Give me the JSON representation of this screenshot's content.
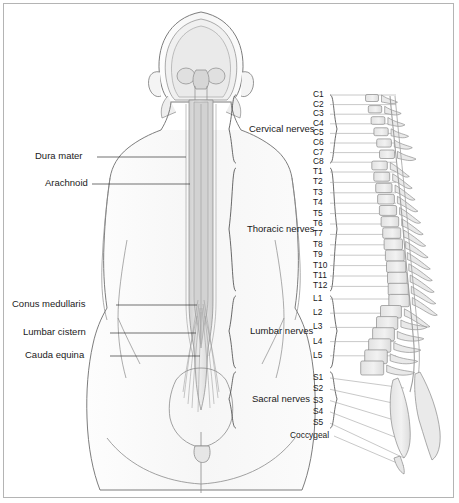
{
  "figure": {
    "view": "posterior body outline with spinal cord; lateral vertebral column at right",
    "colors": {
      "background": "#ffffff",
      "border": "#b4b4b4",
      "outline": "#6e6e6e",
      "bone_fill": "#e8e8e8",
      "cord_fill": "#dcdcdc",
      "text": "#1a1a1a",
      "leader": "#333333"
    }
  },
  "structure_labels": [
    {
      "name": "dura-mater",
      "text": "Dura mater",
      "x": 35,
      "y": 157
    },
    {
      "name": "arachnoid",
      "text": "Arachnoid",
      "x": 45,
      "y": 184
    },
    {
      "name": "conus-medullaris",
      "text": "Conus medullaris",
      "x": 12,
      "y": 305
    },
    {
      "name": "lumbar-cistern",
      "text": "Lumbar cistern",
      "x": 23,
      "y": 333
    },
    {
      "name": "cauda-equina",
      "text": "Cauda equina",
      "x": 25,
      "y": 356
    }
  ],
  "nerve_groups": [
    {
      "name": "cervical-nerves",
      "text": "Cervical nerves",
      "x": 249,
      "y": 129,
      "brace_top": 95,
      "brace_bottom": 163
    },
    {
      "name": "thoracic-nerves",
      "text": "Thoracic nerves",
      "x": 247,
      "y": 229,
      "brace_top": 168,
      "brace_bottom": 291
    },
    {
      "name": "lumbar-nerves",
      "text": "Lumbar nerves",
      "x": 250,
      "y": 331,
      "brace_top": 296,
      "brace_bottom": 368
    },
    {
      "name": "sacral-nerves",
      "text": "Sacral nerves",
      "x": 252,
      "y": 399,
      "brace_top": 372,
      "brace_bottom": 428
    }
  ],
  "vertebral_levels": {
    "cervical": [
      "C1",
      "C2",
      "C3",
      "C4",
      "C5",
      "C6",
      "C7",
      "C8"
    ],
    "thoracic": [
      "T1",
      "T2",
      "T3",
      "T4",
      "T5",
      "T6",
      "T7",
      "T8",
      "T9",
      "T10",
      "T11",
      "T12"
    ],
    "lumbar": [
      "L1",
      "L2",
      "L3",
      "L4",
      "L5"
    ],
    "sacral": [
      "S1",
      "S2",
      "S3",
      "S4",
      "S5"
    ],
    "coccygeal": "Coccygeal"
  },
  "vertebral_label_positions": {
    "x": 313,
    "cervical_start_y": 95,
    "cervical_step": 9.6,
    "thoracic_start_y": 172,
    "thoracic_step": 10.4,
    "lumbar_start_y": 299,
    "lumbar_step": 14.2,
    "sacral_start_y": 378,
    "sacral_step": 11.3,
    "coccygeal_y": 436,
    "coccygeal_x": 290
  }
}
